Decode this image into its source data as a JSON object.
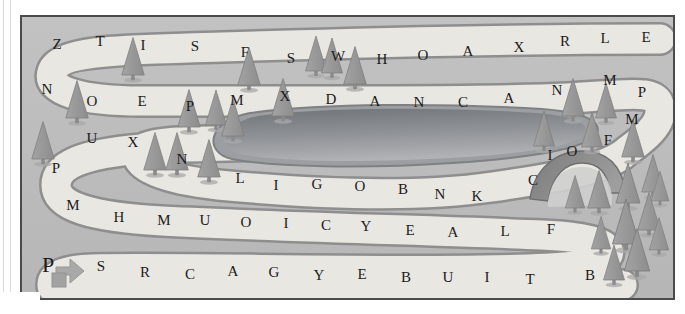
{
  "map": {
    "title": "word-path-maze-map",
    "frame_border_color": "#4b4b4b",
    "background_color": "#bdbdbd",
    "path_fill_color": "#e9e7e2",
    "path_outline_color": "#8e8e8e",
    "lake_color": "#8f9194",
    "tree_color": "#9a9a9a",
    "bridge_color": "#8b8b8b",
    "start_marker_color": "#a6a6a6"
  },
  "start_marker": {
    "name": "start-arrow-marker",
    "label": ""
  },
  "rows": [
    {
      "id": "row-1",
      "letters": [
        {
          "char": "Z",
          "x": 57,
          "y": 44
        },
        {
          "char": "T",
          "x": 100,
          "y": 41
        },
        {
          "char": "I",
          "x": 143,
          "y": 45
        },
        {
          "char": "S",
          "x": 195,
          "y": 46
        },
        {
          "char": "F",
          "x": 245,
          "y": 52
        },
        {
          "char": "S",
          "x": 291,
          "y": 58
        },
        {
          "char": "W",
          "x": 338,
          "y": 56
        },
        {
          "char": "H",
          "x": 382,
          "y": 59
        },
        {
          "char": "O",
          "x": 423,
          "y": 55
        },
        {
          "char": "A",
          "x": 468,
          "y": 51
        },
        {
          "char": "X",
          "x": 519,
          "y": 47
        },
        {
          "char": "R",
          "x": 565,
          "y": 41
        },
        {
          "char": "L",
          "x": 605,
          "y": 38
        },
        {
          "char": "E",
          "x": 646,
          "y": 37
        }
      ]
    },
    {
      "id": "row-2",
      "letters": [
        {
          "char": "N",
          "x": 47,
          "y": 89
        },
        {
          "char": "O",
          "x": 92,
          "y": 101
        },
        {
          "char": "E",
          "x": 142,
          "y": 101
        },
        {
          "char": "P",
          "x": 190,
          "y": 106
        },
        {
          "char": "M",
          "x": 237,
          "y": 100
        },
        {
          "char": "X",
          "x": 285,
          "y": 96
        },
        {
          "char": "D",
          "x": 331,
          "y": 99
        },
        {
          "char": "A",
          "x": 375,
          "y": 101
        },
        {
          "char": "N",
          "x": 419,
          "y": 102
        },
        {
          "char": "C",
          "x": 463,
          "y": 102
        },
        {
          "char": "A",
          "x": 509,
          "y": 98
        },
        {
          "char": "N",
          "x": 557,
          "y": 90
        },
        {
          "char": "M",
          "x": 610,
          "y": 80
        },
        {
          "char": "P",
          "x": 642,
          "y": 92
        }
      ]
    },
    {
      "id": "row-3",
      "letters": [
        {
          "char": "U",
          "x": 92,
          "y": 138
        },
        {
          "char": "X",
          "x": 133,
          "y": 142
        },
        {
          "char": "N",
          "x": 182,
          "y": 159
        },
        {
          "char": "M",
          "x": 632,
          "y": 119
        },
        {
          "char": "F",
          "x": 608,
          "y": 140
        }
      ]
    },
    {
      "id": "row-4",
      "letters": [
        {
          "char": "P",
          "x": 56,
          "y": 168
        },
        {
          "char": "L",
          "x": 240,
          "y": 178
        },
        {
          "char": "I",
          "x": 276,
          "y": 185
        },
        {
          "char": "G",
          "x": 317,
          "y": 184
        },
        {
          "char": "O",
          "x": 360,
          "y": 186
        },
        {
          "char": "B",
          "x": 403,
          "y": 189
        },
        {
          "char": "N",
          "x": 440,
          "y": 194
        },
        {
          "char": "K",
          "x": 477,
          "y": 196
        },
        {
          "char": "C",
          "x": 533,
          "y": 180
        },
        {
          "char": "I",
          "x": 550,
          "y": 155
        },
        {
          "char": "O",
          "x": 572,
          "y": 151
        }
      ]
    },
    {
      "id": "row-5",
      "letters": [
        {
          "char": "M",
          "x": 73,
          "y": 205
        },
        {
          "char": "H",
          "x": 119,
          "y": 217
        },
        {
          "char": "M",
          "x": 164,
          "y": 220
        },
        {
          "char": "U",
          "x": 205,
          "y": 220
        },
        {
          "char": "O",
          "x": 246,
          "y": 222
        },
        {
          "char": "I",
          "x": 286,
          "y": 223
        },
        {
          "char": "C",
          "x": 326,
          "y": 225
        },
        {
          "char": "Y",
          "x": 366,
          "y": 226
        },
        {
          "char": "E",
          "x": 410,
          "y": 230
        },
        {
          "char": "A",
          "x": 453,
          "y": 232
        },
        {
          "char": "L",
          "x": 505,
          "y": 231
        },
        {
          "char": "F",
          "x": 551,
          "y": 229
        }
      ]
    },
    {
      "id": "row-6",
      "letters": [
        {
          "char": "P",
          "x": 48,
          "y": 265,
          "size": "large"
        },
        {
          "char": "S",
          "x": 101,
          "y": 266
        },
        {
          "char": "R",
          "x": 145,
          "y": 272
        },
        {
          "char": "C",
          "x": 190,
          "y": 274
        },
        {
          "char": "A",
          "x": 233,
          "y": 271
        },
        {
          "char": "G",
          "x": 274,
          "y": 272
        },
        {
          "char": "Y",
          "x": 319,
          "y": 275
        },
        {
          "char": "E",
          "x": 362,
          "y": 274
        },
        {
          "char": "B",
          "x": 406,
          "y": 277
        },
        {
          "char": "U",
          "x": 448,
          "y": 277
        },
        {
          "char": "I",
          "x": 487,
          "y": 277
        },
        {
          "char": "T",
          "x": 530,
          "y": 279
        },
        {
          "char": "B",
          "x": 590,
          "y": 275
        }
      ]
    }
  ],
  "sequence": "ZTISFSWHOAXRLE NOEPMXDANCANMP UXN LIGOBNK C IO F MHMUOICYEALF PSRCAGYEBUITB"
}
